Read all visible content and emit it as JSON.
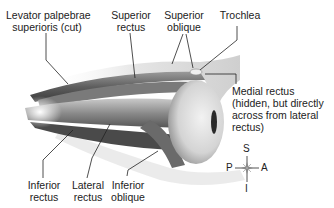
{
  "diagram": {
    "labels": {
      "levator": {
        "line1": "Levator palpebrae",
        "line2": "superioris (cut)"
      },
      "superior_rectus": {
        "line1": "Superior",
        "line2": "rectus"
      },
      "superior_oblique": {
        "line1": "Superior",
        "line2": "oblique"
      },
      "trochlea": {
        "line1": "Trochlea"
      },
      "medial_rectus": {
        "line1": "Medial rectus",
        "line2": "(hidden, but directly",
        "line3": "across from lateral",
        "line4": "rectus)"
      },
      "inferior_rectus": {
        "line1": "Inferior",
        "line2": "rectus"
      },
      "lateral_rectus": {
        "line1": "Lateral",
        "line2": "rectus"
      },
      "inferior_oblique": {
        "line1": "Inferior",
        "line2": "oblique"
      }
    },
    "compass": {
      "superior": "S",
      "posterior": "P",
      "anterior": "A",
      "inferior": "I"
    }
  }
}
